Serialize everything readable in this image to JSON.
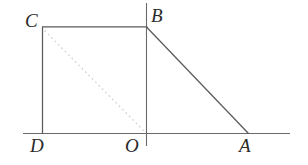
{
  "figure": {
    "background_color": "#ffffff",
    "stroke_color": "#5a5a5a",
    "dotted_color": "#cfcfcf",
    "label_color": "#2b2b2b",
    "width": 308,
    "height": 165,
    "labels": {
      "A": "A",
      "B": "B",
      "C": "C",
      "D": "D",
      "O": "O"
    },
    "points": {
      "A": {
        "x": 248,
        "y": 133
      },
      "B": {
        "x": 146,
        "y": 27
      },
      "C": {
        "x": 42,
        "y": 27
      },
      "D": {
        "x": 42,
        "y": 133
      },
      "O": {
        "x": 146,
        "y": 133
      }
    },
    "segments": [
      {
        "name": "segment-CB",
        "x1": 42,
        "y1": 27,
        "x2": 147,
        "y2": 27,
        "style": "solid"
      },
      {
        "name": "segment-CD",
        "x1": 42,
        "y1": 27,
        "x2": 42,
        "y2": 133,
        "style": "solid"
      },
      {
        "name": "segment-BA",
        "x1": 146,
        "y1": 27,
        "x2": 248,
        "y2": 133,
        "style": "solid"
      },
      {
        "name": "segment-CO-dotted",
        "x1": 44,
        "y1": 30,
        "x2": 145,
        "y2": 132,
        "style": "dotted"
      }
    ],
    "axes": {
      "x_axis": {
        "name": "x-axis",
        "x1": 23,
        "y1": 133,
        "x2": 290,
        "y2": 133
      },
      "y_axis": {
        "name": "y-axis",
        "x1": 146,
        "y1": 3,
        "x2": 146,
        "y2": 146
      }
    }
  }
}
